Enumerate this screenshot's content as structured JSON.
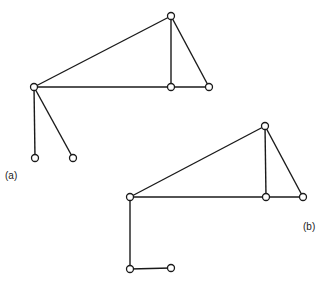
{
  "labels": {
    "a": "(a)",
    "b": "(b)"
  },
  "graphs": [
    {
      "name": "graph-a",
      "nodes": [
        [
          171,
          16
        ],
        [
          34,
          87
        ],
        [
          171,
          87
        ],
        [
          209,
          87
        ],
        [
          35,
          158
        ],
        [
          73,
          158
        ]
      ],
      "edges": [
        [
          0,
          1
        ],
        [
          0,
          2
        ],
        [
          0,
          3
        ],
        [
          1,
          2
        ],
        [
          2,
          3
        ],
        [
          1,
          4
        ],
        [
          1,
          5
        ]
      ]
    },
    {
      "name": "graph-b",
      "nodes": [
        [
          265,
          126
        ],
        [
          130,
          197
        ],
        [
          266,
          197
        ],
        [
          303,
          197
        ],
        [
          130,
          269
        ],
        [
          171,
          268
        ]
      ],
      "edges": [
        [
          0,
          1
        ],
        [
          0,
          2
        ],
        [
          0,
          3
        ],
        [
          1,
          2
        ],
        [
          2,
          3
        ],
        [
          1,
          4
        ],
        [
          4,
          5
        ]
      ]
    }
  ],
  "colors": {
    "stroke": "#1a1a1a",
    "background": "#ffffff"
  }
}
